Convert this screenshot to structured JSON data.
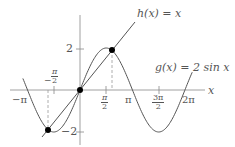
{
  "chart_data": {
    "type": "line",
    "title": "",
    "xlabel": "x",
    "ylabel": "",
    "series": [
      {
        "name": "h(x) = x",
        "label": "h(x) = x",
        "expression": "x",
        "color": "#555555"
      },
      {
        "name": "g(x) = 2 sin x",
        "label": "g(x) = 2 sin x",
        "expression": "2*sin(x)",
        "color": "#555555"
      }
    ],
    "intersections": [
      {
        "x": -1.895,
        "y": -1.895
      },
      {
        "x": 0,
        "y": 0
      },
      {
        "x": 1.895,
        "y": 1.895
      }
    ],
    "x_ticks": [
      "-π",
      "-π/2",
      "π/2",
      "π",
      "3π/2",
      "2π"
    ],
    "y_ticks": [
      "2",
      "-2"
    ],
    "xlim": [
      -3.6,
      6.9
    ],
    "ylim": [
      -2.6,
      4.3
    ],
    "grid": false,
    "legend": "inline labels"
  },
  "labels": {
    "h": "h(x) = x",
    "g_prefix": "g(x) = 2 sin ",
    "g_var": "x",
    "x_axis": "x",
    "y_two": "2",
    "y_neg_two": "−2",
    "neg_pi": "−π",
    "neg_half_pi_sign": "−",
    "pi_sym": "π",
    "half_den": "2",
    "three_pi": "3π",
    "pi": "π",
    "two_pi": "2π"
  }
}
